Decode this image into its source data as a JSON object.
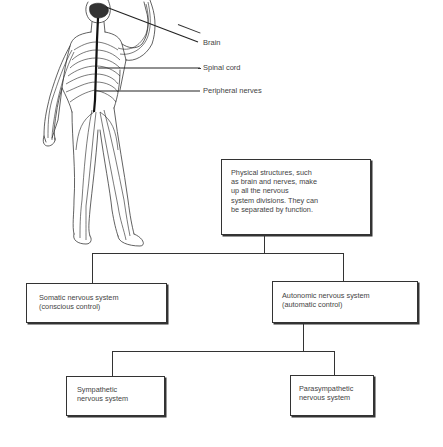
{
  "anatomy": {
    "labels": [
      {
        "text": "Brain"
      },
      {
        "text": "Spinal cord"
      },
      {
        "text": "Peripheral nerves"
      }
    ]
  },
  "tree": {
    "root": {
      "lines": [
        "Physical structures, such",
        "as brain and nerves, make",
        "up all the nervous",
        "system divisions. They can",
        "be separated by function."
      ]
    },
    "somatic": {
      "lines": [
        "Somatic nervous system",
        "(conscious control)"
      ]
    },
    "autonomic": {
      "lines": [
        "Autonomic nervous system",
        "(automatic control)"
      ]
    },
    "sympathetic": {
      "lines": [
        "Sympathetic",
        "nervous system"
      ]
    },
    "parasympathetic": {
      "lines": [
        "Parasympathetic",
        "nervous system"
      ]
    }
  },
  "colors": {
    "line": "#333333",
    "text": "#444444",
    "background": "#ffffff"
  }
}
